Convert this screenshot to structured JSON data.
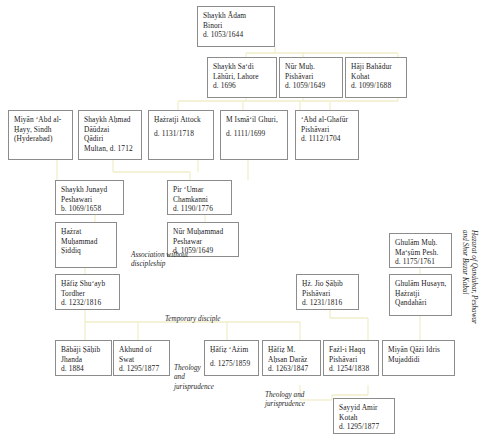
{
  "diagram": {
    "type": "genealogy-tree",
    "line_color": "#f2efd0",
    "box_border_color": "#8c8c8c",
    "side_caption": {
      "line1": "Hazarat of Qandahar, Peshawar",
      "line2": "and Shor Bazar Kabul"
    },
    "nodes": [
      {
        "id": "adam-binori",
        "l1": "Shaykh Ādam",
        "l2": "Binori",
        "l3": "d. 1053/1644",
        "l4": ""
      },
      {
        "id": "sadi-lahuri",
        "l1": "Shaykh Sa‘di",
        "l2": "Lāhūri, Lahore",
        "l3": "d. 1696",
        "l4": ""
      },
      {
        "id": "nur-muh-pishavari",
        "l1": "Nūr Muḥ.",
        "l2": "Pishāvari",
        "l3": "d. 1059/1649",
        "l4": ""
      },
      {
        "id": "haji-bahadur",
        "l1": "Hāji Bahādur",
        "l2": "Kohat",
        "l3": "d. 1099/1688",
        "l4": ""
      },
      {
        "id": "abd-al-hayy",
        "l1": "Miyān ‘Abd al-",
        "l2": "Ḥayy, Sindh",
        "l3": "(Hyderabad)",
        "l4": ""
      },
      {
        "id": "ahmad-daudzai",
        "l1": "Shaykh Aḥmad",
        "l2": "Dāūdzai",
        "l3": "Qādiri",
        "l4": "Multan, d. 1712"
      },
      {
        "id": "hazratji-attock",
        "l1": "Ḥażratji Attock",
        "l2": "",
        "l3": "d. 1131/1718",
        "l4": ""
      },
      {
        "id": "m-ismail-ghuri",
        "l1": "M Ismā‘il Ghuri,",
        "l2": "",
        "l3": "d. 1111/1699",
        "l4": ""
      },
      {
        "id": "abd-al-ghafur",
        "l1": "‘Abd al-Ghafūr",
        "l2": "Pishāvari",
        "l3": "d. 1112/1704",
        "l4": ""
      },
      {
        "id": "shaykh-junayd",
        "l1": "Shaykh Junayd",
        "l2": "Peshawari",
        "l3": "b. 1069/1658",
        "l4": ""
      },
      {
        "id": "pir-umar",
        "l1": "Pir ‘Umar",
        "l2": "Chamkanni",
        "l3": "d. 1190/1776",
        "l4": ""
      },
      {
        "id": "muhammad-siddiq",
        "l1": "Ḥażrat",
        "l2": "Muḥammad",
        "l3": "Ṣiddiq",
        "l4": ""
      },
      {
        "id": "nur-muhammad-pesh",
        "l1": "Nūr Muḥammad",
        "l2": "Peshawar",
        "l3": "d. 1059/1649",
        "l4": ""
      },
      {
        "id": "ghulam-muh-masum",
        "l1": "Ghulām Muḥ.",
        "l2": "Ma‘ṣūm Pesh.",
        "l3": "d. 1175/1761",
        "l4": ""
      },
      {
        "id": "hafiz-shuayb",
        "l1": "Ḥāfiẓ Shu‘ayb",
        "l2": "Tordher",
        "l3": "d. 1232/1816",
        "l4": ""
      },
      {
        "id": "hz-jio-sahib",
        "l1": "Ḥż. Jio Ṣāḥib",
        "l2": "Pishāvari",
        "l3": "d. 1231/1816",
        "l4": ""
      },
      {
        "id": "ghulam-husayn",
        "l1": "Ghulām Husayn,",
        "l2": "Ḥażratji",
        "l3": "Qandahāri",
        "l4": ""
      },
      {
        "id": "babaji-sahib",
        "l1": "Bābāji Ṣāḥib",
        "l2": "Jhanda",
        "l3": "d. 1884",
        "l4": ""
      },
      {
        "id": "akhund-of-swat",
        "l1": "Akhund of",
        "l2": "Swat",
        "l3": "d. 1295/1877",
        "l4": ""
      },
      {
        "id": "hafiz-azim",
        "l1": "Ḥāfiẓ ‘Ażim",
        "l2": "",
        "l3": "d. 1275/1859",
        "l4": ""
      },
      {
        "id": "hafiz-ahsan-daraz",
        "l1": "Ḥāfiẓ M.",
        "l2": "Aḥsan Darāz",
        "l3": "d. 1263/1847",
        "l4": ""
      },
      {
        "id": "fazl-i-haqq",
        "l1": "Fażl-i Haqq",
        "l2": "Pishāvari",
        "l3": "d. 1254/1838",
        "l4": ""
      },
      {
        "id": "miyan-qazi-idris",
        "l1": "Miyān Qāżi Idris",
        "l2": "Mujaddidi",
        "l3": "",
        "l4": ""
      },
      {
        "id": "sayyid-amir-kotah",
        "l1": "Sayyid Amir",
        "l2": "Kotah",
        "l3": "d. 1295/1877",
        "l4": ""
      }
    ],
    "annotations": [
      {
        "id": "association-without-discipleship",
        "l1": "Association without",
        "l2": "discipleship",
        "l3": ""
      },
      {
        "id": "temporary-disciple",
        "l1": "Temporary disciple",
        "l2": "",
        "l3": ""
      },
      {
        "id": "theology-and-jurisprudence-left",
        "l1": "Theology",
        "l2": "and",
        "l3": "jurisprudence"
      },
      {
        "id": "theology-and-jurisprudence-right",
        "l1": "Theology and",
        "l2": "jurisprudence",
        "l3": ""
      }
    ]
  }
}
